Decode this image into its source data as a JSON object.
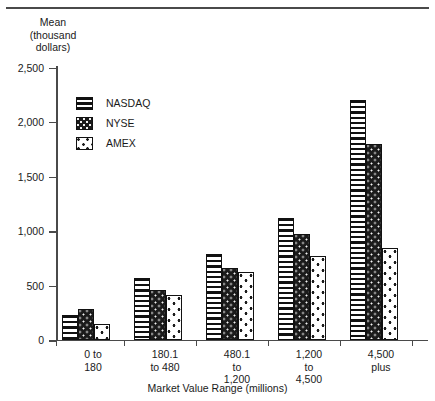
{
  "chart_data": {
    "type": "bar",
    "title": "",
    "ylabel": "Mean\n(thousand\ndollars)",
    "xlabel": "Market Value Range (millions)",
    "categories": [
      "0 to\n180",
      "180.1\nto 480",
      "480.1\nto\n1,200",
      "1,200\nto\n4,500",
      "4,500\nplus"
    ],
    "series": [
      {
        "name": "NASDAQ",
        "values": [
          220,
          565,
          780,
          1115,
          2190
        ]
      },
      {
        "name": "NYSE",
        "values": [
          275,
          450,
          655,
          965,
          1790
        ]
      },
      {
        "name": "AMEX",
        "values": [
          140,
          410,
          620,
          765,
          840
        ]
      }
    ],
    "ylim": [
      0,
      2500
    ],
    "yticks": [
      0,
      500,
      1000,
      1500,
      2000,
      2500
    ],
    "ytick_labels": [
      "0",
      "500",
      "1,000",
      "1,500",
      "2,000",
      "2,500"
    ],
    "grid": false,
    "legend_position": "upper-left-inside",
    "colors": {
      "nasdaq": "#ffffff",
      "nyse": "#1b1b1b",
      "amex": "#ffffff",
      "outline": "#111111",
      "axis": "#4a4a4a",
      "text": "#1a1a1a"
    },
    "patterns": {
      "nasdaq": "horizontal-stripes",
      "nyse": "dark-speckled",
      "amex": "white-sparse-dots"
    }
  }
}
